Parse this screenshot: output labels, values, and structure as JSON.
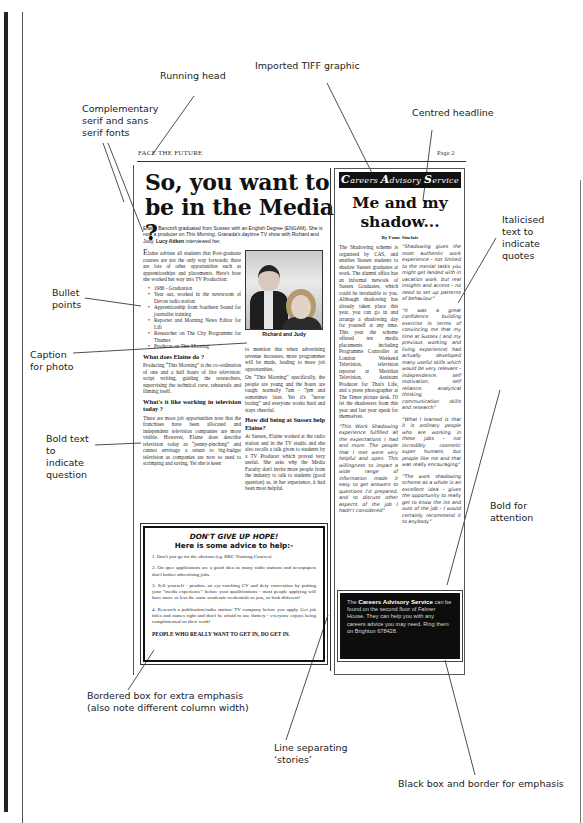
{
  "annotations": {
    "running_head": "Running head",
    "imported_tiff": "Imported TIFF graphic",
    "centred_headline": "Centred headline",
    "complementary_fonts": [
      "Complementary",
      "serif and sans",
      "serif fonts"
    ],
    "italicised_quotes": [
      "Italicised",
      "text to",
      "indicate",
      "quotes"
    ],
    "bullet_points": [
      "Bullet",
      "points"
    ],
    "caption_for_photo": [
      "Caption",
      "for photo"
    ],
    "bold_question": [
      "Bold text",
      "to",
      "indicate",
      "question"
    ],
    "bold_attention": [
      "Bold for",
      "attention"
    ],
    "bordered_box": [
      "Bordered box for extra emphasis",
      "(also note different column width)"
    ],
    "line_separating": [
      "Line separating",
      "‘stories’"
    ],
    "black_box": "Black box and border for emphasis"
  },
  "page": {
    "running_head": "FACE THE FUTURE",
    "page_number": "Page 2",
    "headline": "So, you want to be in the Media ?",
    "standfirst_pre": "Elaine Bancroft graduated from Sussex with an English Degree (ENGAM). She is now a producer on ",
    "standfirst_show": "This Morning",
    "standfirst_mid": ", Granada's daytime TV show with Richard and Judy. ",
    "standfirst_author": "Lucy Aitken",
    "standfirst_post": " interviewed her.",
    "intro_dropcap": "E",
    "intro": "laine advises all students that Post-graduate courses are not the only way forwards; there are lots of other opportunities such as apprenticeships and placements. Here's how she worked her way into TV Production:",
    "bullets": [
      "1986 - Graduation",
      "Year out, worked in the newsroom of Devon radio station",
      "Apprenticeship from Southern Sound for journalist training",
      "Reporter and Morning News Editor for Lifi",
      "Researcher on The City Programme for Thames",
      "Producer on This Morning"
    ],
    "q1": "What does Elaine do ?",
    "a1": "Producing “This Morning” is the co-ordination of one and a half hours of live television: script writing, guiding the researchers, supervising the technical crew, rehearsals and filming itself.",
    "q2": "What's it like working in television today ?",
    "a2": "There are more job opportunities now that the franchises have been allocated and independent television companies are more visible. However, Elaine does describe television today as “penny-pinching” and cannot envisage a return to big-budget television as companies are now so used to scrimping and saving. Yet she is keen",
    "photo_caption": "Richard and Judy",
    "a2_cont": "to mention that when advertising revenue increases, more programmes will be made, leading to more job opportunities.",
    "a2_cont2": "On “This Morning” specifically, the people are young and the hours are tough: normally 7am - 7pm and sometimes later. Yet it's “never boring” and everyone works hard and stays cheerful.",
    "q3": "How did being at Sussex help Elaine?",
    "a3": "At Sussex, Elaine worked at the radio station and in the TV studio and she also recalls a talk given to students by a TV Producer which proved very useful. She asks why the Media Faculty don't invite more people from the industry to talk to students (good question) as, in her experience, it had been most helpful."
  },
  "advice_box": {
    "title": "DON'T GIVE UP HOPE!",
    "subtitle": "Here is some advice to help:-",
    "items": [
      "1. Don't just go for the obvious (eg. BBC Training Courses)",
      "2. On spec applications are a good idea as many radio stations and newspapers don't bother advertising jobs.",
      "3. Sell yourself - produce an eye-catching CV and defy convention by putting your “media experience” before your qualifications - most people applying will have more or less the same academic credentials as you, so look different!",
      "4. Research a publication/radio station/ TV company before you apply. Get job titles and names right and don't be afraid to use flattery - everyone enjoys being complimented on their work!"
    ],
    "footer": "PEOPLE WHO REALLY WANT TO GET IN, DO GET IN."
  },
  "careers_story": {
    "banner_c": "C",
    "banner_1": "areers ",
    "banner_a": "A",
    "banner_2": "dvisory ",
    "banner_s": "S",
    "banner_3": "ervice",
    "headline": "Me and my shadow...",
    "byline": "By Fame Sinclair",
    "body": "The Shadowing scheme is organised by CAS, and enables Sussex students to shadow Sussex graduates at work. The alumni office has an informal network of Sussex Graduates, which could be invaluable to you. Although shadowing has already taken place this year, you can go in and arrange a shadowing day for yourself at any time. This year the scheme offered ten media placements including Programme Controller at London Weekend Television, television reporter at Meridian Television, Assistant Producer for That's Life, and a press photographer at The Times picture desk. I'll let the shadowers from this year and last year speak for themselves.",
    "quote1": "“This Work Shadowing experience fulfilled all the expectations I had and more. The people that I met were very helpful and open. This willingness to impart a wide range of information made it easy to get answers to questions I'd prepared, and to discuss other aspects of the job I hadn't considered”",
    "quote2": "“Shadowing gives the most authentic work experience - not limited to the menial tasks you might get landed with in vacation work, but real insights and access - no need to set up patterns of behaviour”",
    "quote3": "“It was a great confidence building exercise in terms of convincing me that my time at Sussex ( and my previous working and living experience) had actually developed many useful skills which would be very relevant - independence, self motivation, self reliance, analytical thinking, communication skills and research”",
    "quote4": "“What I learned is that it is ordinary people who are working in these jobs - not incredibly cosmetic super humans, but people like me and that was really encouraging”",
    "quote5": "“The work shadowing scheme as a whole is an excellent idea - gives the opportunity to really get to know the ins and outs of the job - I would certainly recommend it to anybody”"
  },
  "black_box": {
    "pre": "The ",
    "bold": "Careers Advisory Service",
    "post": " can be found on the second floor of Falmer House. They can help you with any careers advice you may need. Ring them on Brighton 678428."
  }
}
